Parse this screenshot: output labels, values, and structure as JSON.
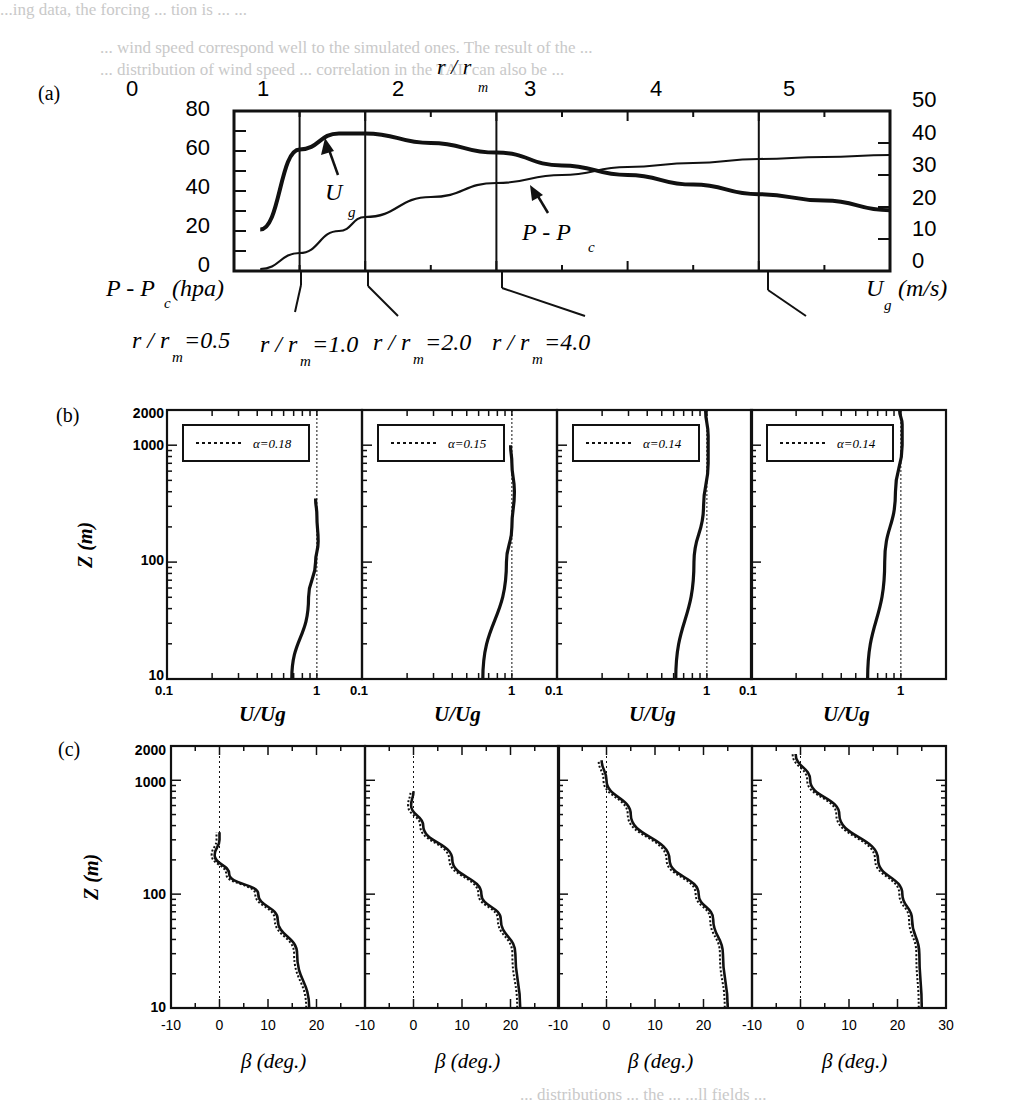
{
  "ghost_text": {
    "top_line": "...ing data, the forcing ... tion is ... ...",
    "line2": "... wind speed correspond well to the simulated ones. The result of the ...",
    "line3": "... distribution of wind speed ... correlation in the TAL can also be ...",
    "bottom_line": "... distributions ... the ... ...ll fields ..."
  },
  "panel_a": {
    "label": "(a)",
    "top_axis_title": "r / r",
    "top_axis_title_sub": "m",
    "top_ticks": [
      "0",
      "1",
      "2",
      "3",
      "4",
      "5"
    ],
    "left_ticks": [
      "80",
      "60",
      "40",
      "20",
      "0"
    ],
    "right_ticks": [
      "50",
      "40",
      "30",
      "20",
      "10",
      "0"
    ],
    "left_axis_label": "P - P",
    "left_axis_label_sub": "c",
    "left_axis_unit": "(hpa)",
    "right_axis_label": "U",
    "right_axis_label_sub": "g",
    "right_axis_unit": "(m/s)",
    "annotation_ug": "U",
    "annotation_ug_sub": "g",
    "annotation_p": "P - P",
    "annotation_p_sub": "c",
    "callouts": [
      {
        "text": "r / r",
        "sub": "m",
        "value": "=0.5"
      },
      {
        "text": "r / r",
        "sub": "m",
        "value": "=1.0"
      },
      {
        "text": "r / r",
        "sub": "m",
        "value": "=2.0"
      },
      {
        "text": "r / r",
        "sub": "m",
        "value": "=4.0"
      }
    ]
  },
  "panel_b": {
    "label": "(b)",
    "y_axis_label": "Z (m)",
    "y_ticks": [
      "2000",
      "1000",
      "100",
      "10"
    ],
    "x_label": "U/Ug",
    "subplots": [
      {
        "legend": "α=0.18",
        "x_ticks": [
          "0.1",
          "1"
        ]
      },
      {
        "legend": "α=0.15",
        "x_ticks": [
          "0.1",
          "1"
        ]
      },
      {
        "legend": "α=0.14",
        "x_ticks": [
          "0.1",
          "1"
        ]
      },
      {
        "legend": "α=0.14",
        "x_ticks": [
          "0.1",
          "1"
        ]
      }
    ]
  },
  "panel_c": {
    "label": "(c)",
    "y_axis_label": "Z (m)",
    "y_ticks": [
      "2000",
      "1000",
      "100",
      "10"
    ],
    "x_label": "β (deg.)",
    "subplots": [
      {
        "x_ticks": [
          "-10",
          "0",
          "10",
          "20"
        ]
      },
      {
        "x_ticks": [
          "-10",
          "0",
          "10",
          "20"
        ]
      },
      {
        "x_ticks": [
          "-10",
          "0",
          "10",
          "20"
        ]
      },
      {
        "x_ticks": [
          "-10",
          "0",
          "10",
          "20",
          "30"
        ]
      }
    ]
  },
  "chart_data": [
    {
      "type": "line",
      "title": "(a) Radial profiles",
      "xlabel": "r / r_m",
      "x": [
        0.2,
        0.5,
        0.8,
        1.0,
        1.5,
        2.0,
        2.5,
        3.0,
        3.5,
        4.0,
        4.5,
        5.0
      ],
      "xlim": [
        0,
        5
      ],
      "series": [
        {
          "name": "U_g (m/s)",
          "axis": "right",
          "ylim": [
            0,
            50
          ],
          "values": [
            13,
            38,
            43,
            43,
            40,
            37,
            33,
            30,
            27,
            24,
            22,
            19
          ]
        },
        {
          "name": "P - P_c (hpa)",
          "axis": "left",
          "ylim": [
            0,
            80
          ],
          "values": [
            1,
            9,
            20,
            27,
            37,
            44,
            48,
            52,
            54,
            56,
            57,
            58
          ]
        }
      ],
      "ylabel_left": "P - P_c (hpa)",
      "ylabel_right": "U_g (m/s)",
      "vertical_markers": [
        0.5,
        1.0,
        2.0,
        4.0
      ]
    },
    {
      "type": "line",
      "title": "(b) Wind speed profiles U/Ug",
      "xlabel": "U/Ug",
      "ylabel": "Z (m)",
      "xscale": "log",
      "yscale": "log",
      "xlim": [
        0.1,
        2
      ],
      "ylim": [
        10,
        2000
      ],
      "panels": [
        {
          "r_over_rm": 0.5,
          "alpha": 0.18,
          "z": [
            10,
            50,
            100,
            150,
            250,
            350
          ],
          "u": [
            0.68,
            0.88,
            0.98,
            1.02,
            1.0,
            0.98
          ]
        },
        {
          "r_over_rm": 1.0,
          "alpha": 0.15,
          "z": [
            10,
            100,
            200,
            400,
            700,
            1000
          ],
          "u": [
            0.64,
            0.92,
            1.0,
            1.04,
            1.0,
            0.98
          ]
        },
        {
          "r_over_rm": 2.0,
          "alpha": 0.14,
          "z": [
            10,
            100,
            300,
            700,
            1200,
            2000
          ],
          "u": [
            0.62,
            0.82,
            0.95,
            1.02,
            1.02,
            0.98
          ]
        },
        {
          "r_over_rm": 4.0,
          "alpha": 0.14,
          "z": [
            10,
            100,
            400,
            1000,
            1500,
            2000
          ],
          "u": [
            0.6,
            0.78,
            0.92,
            1.02,
            1.02,
            0.98
          ]
        }
      ]
    },
    {
      "type": "line",
      "title": "(c) Inflow angle profiles",
      "xlabel": "β (deg.)",
      "ylabel": "Z (m)",
      "yscale": "log",
      "xlim": [
        -10,
        30
      ],
      "ylim": [
        10,
        2000
      ],
      "panels": [
        {
          "r_over_rm": 0.5,
          "z": [
            10,
            30,
            60,
            100,
            150,
            220,
            300,
            350
          ],
          "beta": [
            18.5,
            16,
            12,
            8,
            2,
            -1,
            0,
            0
          ]
        },
        {
          "r_over_rm": 1.0,
          "z": [
            10,
            30,
            60,
            100,
            200,
            400,
            600,
            800
          ],
          "beta": [
            22,
            21,
            18,
            14,
            8,
            2,
            -0.5,
            0
          ]
        },
        {
          "r_over_rm": 2.0,
          "z": [
            10,
            30,
            60,
            100,
            200,
            500,
            1000,
            1500
          ],
          "beta": [
            25,
            24,
            22,
            19,
            13,
            5,
            0,
            -1
          ]
        },
        {
          "r_over_rm": 4.0,
          "z": [
            10,
            30,
            60,
            100,
            200,
            500,
            1000,
            1700
          ],
          "beta": [
            25,
            24.5,
            23,
            21,
            16,
            8,
            2,
            -1
          ]
        }
      ]
    }
  ]
}
